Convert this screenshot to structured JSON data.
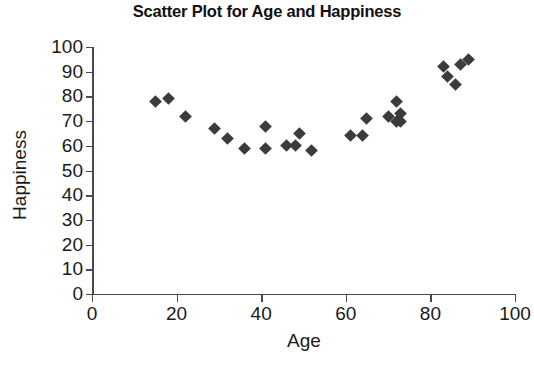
{
  "chart_data": {
    "type": "scatter",
    "title": "Scatter Plot for Age and Happiness",
    "xlabel": "Age",
    "ylabel": "Happiness",
    "xlim": [
      0,
      100
    ],
    "ylim": [
      0,
      100
    ],
    "xticks": [
      0,
      20,
      40,
      60,
      80,
      100
    ],
    "yticks": [
      0,
      10,
      20,
      30,
      40,
      50,
      60,
      70,
      80,
      90,
      100
    ],
    "grid": false,
    "legend": null,
    "marker": "diamond",
    "marker_color": "#3b3b3b",
    "series": [
      {
        "name": "Age vs Happiness",
        "points": [
          [
            15,
            78
          ],
          [
            18,
            79
          ],
          [
            22,
            72
          ],
          [
            29,
            67
          ],
          [
            32,
            63
          ],
          [
            36,
            59
          ],
          [
            41,
            68
          ],
          [
            41,
            59
          ],
          [
            46,
            60
          ],
          [
            48,
            60
          ],
          [
            49,
            65
          ],
          [
            52,
            58
          ],
          [
            61,
            64
          ],
          [
            64,
            64
          ],
          [
            65,
            71
          ],
          [
            70,
            72
          ],
          [
            72,
            70
          ],
          [
            72,
            78
          ],
          [
            73,
            73
          ],
          [
            73,
            70
          ],
          [
            83,
            92
          ],
          [
            84,
            88
          ],
          [
            86,
            85
          ],
          [
            87,
            93
          ],
          [
            89,
            95
          ]
        ]
      }
    ]
  },
  "axes": {
    "x_tick_labels": [
      "0",
      "20",
      "40",
      "60",
      "80",
      "100"
    ],
    "y_tick_labels": [
      "0",
      "10",
      "20",
      "30",
      "40",
      "50",
      "60",
      "70",
      "80",
      "90",
      "100"
    ]
  }
}
